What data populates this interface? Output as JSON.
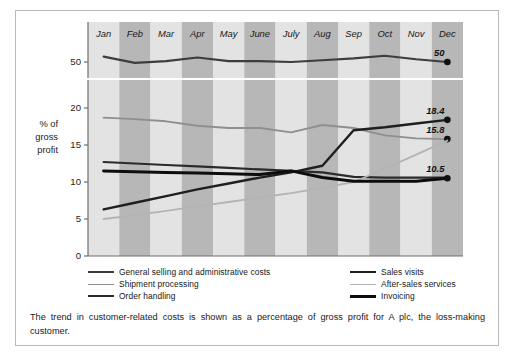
{
  "figure": {
    "caption": "The trend in customer-related costs is shown as a percentage of gross profit for A plc, the loss-making customer."
  },
  "axis": {
    "y_title_line1": "% of",
    "y_title_line2": "gross",
    "y_title_line3": "profit",
    "y_ticks_main": [
      "20",
      "15",
      "10",
      "5",
      "0"
    ],
    "y_tick_break": "50"
  },
  "legend": {
    "items": [
      {
        "label": "General selling and administrative costs",
        "color": "#3d3d3d",
        "width": 2.1,
        "column": "left"
      },
      {
        "label": "Shipment processing",
        "color": "#8f8f8f",
        "width": 1.9,
        "column": "left"
      },
      {
        "label": "Order handling",
        "color": "#2b2b2b",
        "width": 2.2,
        "column": "left"
      },
      {
        "label": "Sales visits",
        "color": "#1f1f1f",
        "width": 2.4,
        "column": "right"
      },
      {
        "label": "After-sales services",
        "color": "#b4b4b4",
        "width": 1.9,
        "column": "right"
      },
      {
        "label": "Invoicing",
        "color": "#0d0d0d",
        "width": 3.0,
        "column": "right"
      }
    ]
  },
  "chart_data": {
    "type": "line",
    "title": "",
    "xlabel": "",
    "ylabel": "% of gross profit",
    "categories": [
      "Jan",
      "Feb",
      "Mar",
      "Apr",
      "May",
      "June",
      "July",
      "Aug",
      "Sep",
      "Oct",
      "Nov",
      "Dec"
    ],
    "ylim_main": [
      0,
      21
    ],
    "ylim_break": [
      48,
      52
    ],
    "axis_break": true,
    "grid": false,
    "legend_position": "bottom",
    "band_shading": [
      "light",
      "dark",
      "light",
      "dark",
      "light",
      "dark",
      "light",
      "dark",
      "light",
      "dark",
      "light",
      "dark"
    ],
    "series": [
      {
        "name": "General selling and administrative costs",
        "panel": "break",
        "color": "#3d3d3d",
        "width": 2.1,
        "end_label": "50",
        "end_marker": true,
        "values": [
          50.6,
          49.9,
          50.1,
          50.5,
          50.1,
          50.1,
          50.0,
          50.2,
          50.4,
          50.7,
          50.3,
          50.0
        ]
      },
      {
        "name": "Shipment processing",
        "panel": "main",
        "color": "#8f8f8f",
        "width": 1.9,
        "end_label": "15.8",
        "end_marker": true,
        "values": [
          18.7,
          18.5,
          18.2,
          17.6,
          17.3,
          17.3,
          16.7,
          17.7,
          17.3,
          16.3,
          15.9,
          15.8
        ]
      },
      {
        "name": "Order handling",
        "panel": "main",
        "color": "#2b2b2b",
        "width": 2.2,
        "end_label": "",
        "end_marker": false,
        "values": [
          12.7,
          12.5,
          12.3,
          12.1,
          11.9,
          11.7,
          11.5,
          11.3,
          10.7,
          10.6,
          10.6,
          10.6
        ]
      },
      {
        "name": "Sales visits",
        "panel": "main",
        "color": "#1f1f1f",
        "width": 2.4,
        "end_label": "18.4",
        "end_marker": true,
        "values": [
          6.3,
          7.2,
          8.1,
          9.0,
          9.8,
          10.6,
          11.3,
          12.2,
          17.0,
          17.4,
          17.9,
          18.4
        ]
      },
      {
        "name": "After-sales services",
        "panel": "main",
        "color": "#b4b4b4",
        "width": 1.9,
        "end_label": "",
        "end_marker": false,
        "values": [
          5.0,
          5.5,
          6.1,
          6.7,
          7.3,
          7.9,
          8.5,
          9.2,
          10.0,
          11.8,
          13.7,
          15.6
        ]
      },
      {
        "name": "Invoicing",
        "panel": "main",
        "color": "#0d0d0d",
        "width": 3.0,
        "end_label": "10.5",
        "end_marker": true,
        "values": [
          11.5,
          11.4,
          11.3,
          11.2,
          11.1,
          11.0,
          11.5,
          10.6,
          10.1,
          10.1,
          10.1,
          10.5
        ]
      }
    ]
  }
}
